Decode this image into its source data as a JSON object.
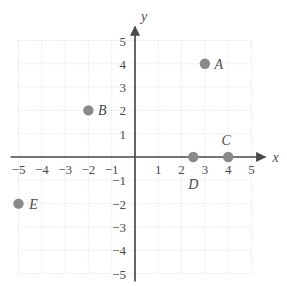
{
  "figure": {
    "kind": "coordinate-plane-scatter",
    "axis_x_name": "x",
    "axis_y_name": "y",
    "grid": "dotted",
    "colors": {
      "point": "#8a8a8a",
      "axis": "#4a4a4a",
      "grid": "#d9d9d9",
      "label": "#4a4a4a",
      "background": "#ffffff"
    }
  },
  "chart_data": {
    "type": "scatter",
    "title": "",
    "xlabel": "x",
    "ylabel": "y",
    "xlim": [
      -5,
      5
    ],
    "ylim": [
      -5,
      5
    ],
    "grid": true,
    "legend": "none",
    "x_ticks": [
      -5,
      -4,
      -3,
      -2,
      -1,
      1,
      2,
      3,
      4,
      5
    ],
    "y_ticks": [
      -5,
      -4,
      -3,
      -2,
      -1,
      1,
      2,
      3,
      4,
      5
    ],
    "x_tick_labels": [
      "−5",
      "−4",
      "−3",
      "−2",
      "−1",
      "1",
      "2",
      "3",
      "4",
      "5"
    ],
    "y_tick_labels": [
      "−5",
      "−4",
      "−3",
      "−2",
      "−1",
      "1",
      "2",
      "3",
      "4",
      "5"
    ],
    "points": [
      {
        "label": "A",
        "x": 3,
        "y": 4,
        "label_dx": 14,
        "label_dy": 5
      },
      {
        "label": "B",
        "x": -2,
        "y": 2,
        "label_dx": 14,
        "label_dy": 5
      },
      {
        "label": "C",
        "x": 4,
        "y": 0,
        "label_dx": -2,
        "label_dy": -12
      },
      {
        "label": "D",
        "x": 2.5,
        "y": 0,
        "label_dx": 0,
        "label_dy": 32
      },
      {
        "label": "E",
        "x": -5,
        "y": -2,
        "label_dx": 15,
        "label_dy": 5
      }
    ]
  }
}
